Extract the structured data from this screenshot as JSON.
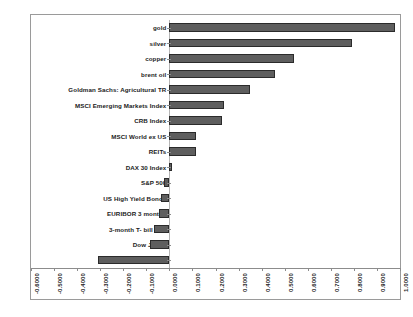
{
  "chart_data": {
    "type": "bar",
    "orientation": "horizontal",
    "title": "",
    "subtitle": "",
    "xlabel": "",
    "ylabel": "",
    "grid": false,
    "legend": false,
    "legend_position": "none",
    "xlim": [
      -0.6,
      1.0
    ],
    "xticks": [
      -0.6,
      -0.5,
      -0.4,
      -0.3,
      -0.2,
      -0.1,
      0.0,
      0.1,
      0.2,
      0.3,
      0.4,
      0.5,
      0.6,
      0.7,
      0.8,
      0.9,
      1.0
    ],
    "xtick_labels": [
      "-0.6000",
      "-0.5000",
      "-0.4000",
      "-0.3000",
      "-0.2000",
      "-0.1000",
      "0.0000",
      "0.1000",
      "0.2000",
      "0.3000",
      "0.4000",
      "0.5000",
      "0.6000",
      "0.7000",
      "0.8000",
      "0.9000",
      "1.0000"
    ],
    "xtick_rotation": 90,
    "categories": [
      "gold",
      "silver",
      "copper",
      "brent oil",
      "Goldman Sachs: Agricultural TR",
      "MSCI Emerging Markets Index",
      "CRB Index",
      "MSCI World ex US",
      "REITs",
      "DAX 30 Index",
      "S&P 500",
      "US High Yield Bonds",
      "EURIBOR 3 months",
      "3-month T- bill rate",
      "Dow Jones",
      "US Dollar Index (DXY)"
    ],
    "values": [
      0.98,
      0.79,
      0.54,
      0.46,
      0.35,
      0.235,
      0.23,
      0.115,
      0.115,
      0.01,
      -0.025,
      -0.035,
      -0.045,
      -0.065,
      -0.085,
      -0.31
    ],
    "bar_color": "#5e5e5e",
    "bar_edge_color": "#2b2b2b",
    "frame_color": "#9a9a9a",
    "axis_color": "#8c8c8c",
    "text_color": "#1b1b1b",
    "background_color": "#ffffff"
  }
}
